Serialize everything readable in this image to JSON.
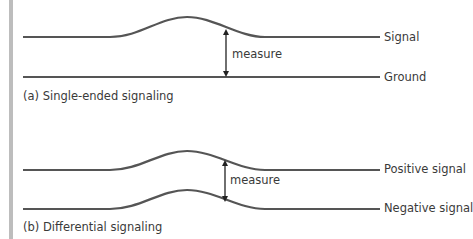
{
  "diagram": {
    "panel_a": {
      "caption": "(a) Single-ended signaling",
      "measure_label": "measure",
      "lines": [
        {
          "name": "Signal",
          "label": "Signal"
        },
        {
          "name": "Ground",
          "label": "Ground"
        }
      ]
    },
    "panel_b": {
      "caption": "(b) Differential signaling",
      "measure_label": "measure",
      "lines": [
        {
          "name": "Positive signal",
          "label": "Positive signal"
        },
        {
          "name": "Negative signal",
          "label": "Negative signal"
        }
      ]
    },
    "colors": {
      "line": "#555555",
      "text": "#3a3a3a",
      "side_bar": "#bdbdbd"
    }
  }
}
